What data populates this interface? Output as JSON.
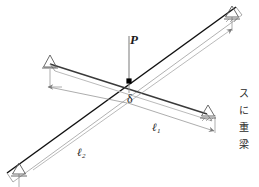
{
  "figure": {
    "type": "engineering-diagram",
    "canvas": {
      "width": 259,
      "height": 187,
      "background": "#ffffff"
    },
    "colors": {
      "beam_long_dark": "#111111",
      "beam_long_light": "#9a9a9a",
      "beam_short_dark": "#4a4a4a",
      "beam_short_light": "#b0b0b0",
      "dimension_line": "#6b6b6b",
      "support_outline": "#6b6b6b",
      "load_line": "#8c8c8c",
      "node_marker": "#000000",
      "text": "#1a1a1a"
    },
    "labels": {
      "load": "P",
      "deflection": "δ",
      "length_1": "ℓ",
      "length_1_sub": "1",
      "length_2": "ℓ",
      "length_2_sub": "2"
    },
    "side_text": {
      "orientation": "vertical-rl",
      "characters": [
        "ス",
        "に",
        "重",
        "梁"
      ],
      "full": "スに重梁"
    },
    "elements": {
      "beam_1_name": "beam-l1-short",
      "beam_2_name": "beam-l2-long",
      "supports": [
        {
          "id": "support-top-right",
          "kind": "roller-hatched"
        },
        {
          "id": "support-left-upper",
          "kind": "roller-plain"
        },
        {
          "id": "support-right-middle",
          "kind": "roller-hatched"
        },
        {
          "id": "support-bottom-left",
          "kind": "roller-plain"
        }
      ],
      "load_arrow": "downward point load at beam intersection",
      "intersection_marker": "filled square node"
    }
  }
}
